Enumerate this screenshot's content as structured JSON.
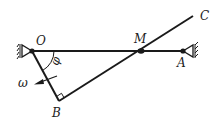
{
  "diagram": {
    "type": "mechanism",
    "labels": {
      "O": "O",
      "M": "M",
      "A": "A",
      "B": "B",
      "C": "C",
      "phi": "φ",
      "omega": "ω"
    },
    "colors": {
      "line": "#1a1a1a",
      "background": "#ffffff"
    }
  }
}
